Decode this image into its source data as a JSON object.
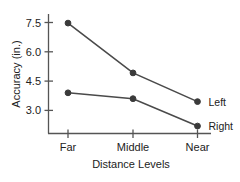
{
  "chart_data": {
    "type": "line",
    "title": "",
    "xlabel": "Distance Levels",
    "ylabel": "Accuracy (in.)",
    "categories": [
      "Far",
      "Middle",
      "Near"
    ],
    "yticks": [
      3.0,
      4.5,
      6.0,
      7.5
    ],
    "ytick_labels": [
      "3.0",
      "4.5",
      "6.0",
      "7.5"
    ],
    "ylim": [
      1.85,
      7.9
    ],
    "grid": false,
    "legend_position": "right-inline",
    "series": [
      {
        "name": "Left",
        "values": [
          7.47,
          4.92,
          3.45
        ]
      },
      {
        "name": "Right",
        "values": [
          3.9,
          3.6,
          2.2
        ]
      }
    ]
  },
  "axis": {
    "x_title": "Distance Levels",
    "y_title": "Accuracy (in.)"
  },
  "ticks": {
    "y": [
      "7.5",
      "6.0",
      "4.5",
      "3.0"
    ],
    "x": [
      "Far",
      "Middle",
      "Near"
    ]
  },
  "legend": {
    "items": [
      {
        "label": "Left"
      },
      {
        "label": "Right"
      }
    ]
  }
}
